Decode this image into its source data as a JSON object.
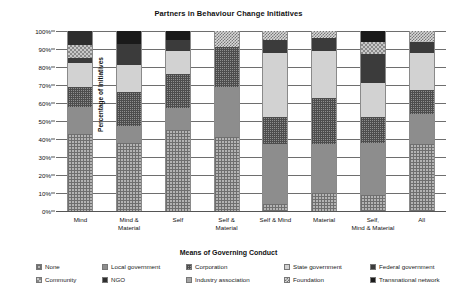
{
  "chart_data": {
    "type": "bar",
    "title": "Partners in Behaviour Change Initiatives",
    "xlabel": "Means of Governing Conduct",
    "ylabel": "Percentage of Initiatives",
    "stacked": true,
    "grid": true,
    "legend_position": "bottom",
    "ylim": [
      0,
      100
    ],
    "ytick_labels": [
      "0%",
      "10%",
      "20%",
      "30%",
      "40%",
      "50%",
      "60%",
      "70%",
      "80%",
      "90%",
      "100%"
    ],
    "ytick_values": [
      0,
      10,
      20,
      30,
      40,
      50,
      60,
      70,
      80,
      90,
      100
    ],
    "categories": [
      "Mind",
      "Mind &\nMaterial",
      "Self",
      "Self &\nMaterial",
      "Self & Mind",
      "Material",
      "Self,\nMind & Material",
      "All"
    ],
    "series": [
      {
        "name": "None",
        "pattern": "p-none",
        "values": [
          43,
          38,
          45,
          41,
          4,
          10,
          9,
          37
        ]
      },
      {
        "name": "Local government",
        "pattern": "p-local",
        "values": [
          15,
          9,
          12,
          28,
          33,
          27,
          29,
          17
        ]
      },
      {
        "name": "Corporation",
        "pattern": "p-corp",
        "values": [
          11,
          19,
          19,
          22,
          15,
          26,
          14,
          13
        ]
      },
      {
        "name": "State government",
        "pattern": "p-state",
        "values": [
          13,
          15,
          13,
          0,
          36,
          26,
          19,
          21
        ]
      },
      {
        "name": "Federal government",
        "pattern": "p-federal",
        "values": [
          3,
          12,
          6,
          0,
          7,
          7,
          16,
          6
        ]
      },
      {
        "name": "Community",
        "pattern": "p-community",
        "values": [
          7,
          0,
          0,
          0,
          0,
          0,
          7,
          0
        ]
      },
      {
        "name": "NGO",
        "pattern": "p-ngo",
        "values": [
          8,
          0,
          0,
          0,
          0,
          0,
          0,
          0
        ]
      },
      {
        "name": "Industry association",
        "pattern": "p-industry",
        "values": [
          0,
          0,
          0,
          0,
          0,
          0,
          0,
          0
        ]
      },
      {
        "name": "Foundation",
        "pattern": "p-foundation",
        "values": [
          0,
          0,
          0,
          9,
          5,
          4,
          0,
          6
        ]
      },
      {
        "name": "Transnational network",
        "pattern": "p-transnational",
        "values": [
          0,
          7,
          5,
          0,
          0,
          0,
          6,
          0
        ]
      }
    ]
  },
  "legend": {
    "items": [
      {
        "label": "None",
        "swatch": "p-none"
      },
      {
        "label": "Local government",
        "swatch": "p-local"
      },
      {
        "label": "Corporation",
        "swatch": "p-corp"
      },
      {
        "label": "State government",
        "swatch": "p-state"
      },
      {
        "label": "Federal government",
        "swatch": "p-federal"
      },
      {
        "label": "Community",
        "swatch": "p-community"
      },
      {
        "label": "NGO",
        "swatch": "p-ngo"
      },
      {
        "label": "Industry association",
        "swatch": "p-industry"
      },
      {
        "label": "Foundation",
        "swatch": "p-foundation"
      },
      {
        "label": "Transnational network",
        "swatch": "p-transnational"
      }
    ]
  }
}
